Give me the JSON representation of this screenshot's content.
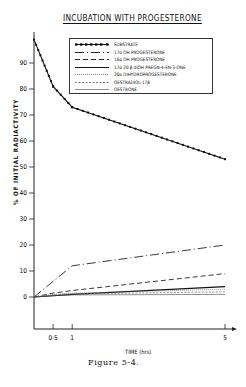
{
  "figure": {
    "title": "INCUBATION WITH PROGESTERONE",
    "caption": "Figure 5-4."
  },
  "chart_data": {
    "type": "line",
    "title": "INCUBATION WITH PROGESTERONE",
    "xlabel": "TIME (hrs)",
    "ylabel": "% OF INITIAL RADIACTIVITY",
    "x": [
      0,
      0.5,
      1,
      5
    ],
    "xticks": [
      "0·5",
      "1",
      "5"
    ],
    "xtick_values": [
      0.5,
      1,
      5
    ],
    "yticks": [
      0,
      10,
      20,
      30,
      40,
      50,
      60,
      70,
      80,
      90
    ],
    "xlim": [
      0,
      5.3
    ],
    "ylim": [
      -10,
      100
    ],
    "grid": false,
    "legend_position": "top-right inside",
    "series": [
      {
        "name": "SUBSTRATE",
        "style": "dotted-markers",
        "values": [
          99,
          81,
          73,
          53
        ]
      },
      {
        "name": "17α OH PROGESTERONE",
        "style": "dash-dot",
        "values": [
          0,
          6,
          12,
          20
        ]
      },
      {
        "name": "16α OH PROGESTERONE",
        "style": "dashed",
        "values": [
          0,
          1.5,
          2.5,
          9
        ]
      },
      {
        "name": "17α 20 β diOH PREGN-4-EN-3-ONE",
        "style": "solid",
        "values": [
          0,
          0.5,
          1,
          4
        ]
      },
      {
        "name": "20α DIHYDROPROGESTERONE",
        "style": "fine-dotted",
        "values": [
          0,
          1,
          1.5,
          3
        ]
      },
      {
        "name": "OESTRADIOL-17β",
        "style": "short-dashed",
        "values": [
          0,
          0.8,
          1.2,
          2
        ]
      },
      {
        "name": "OESTRONE",
        "style": "thin-solid",
        "values": [
          0,
          0.5,
          0.8,
          1
        ]
      }
    ]
  },
  "legend": {
    "items": [
      "SUBSTRATE",
      "17α OH PROGESTERONE",
      "16α OH PROGESTERONE",
      "17α 20 β diOH PREGN-4-EN-3-ONE",
      "20α DIHYDROPROGESTERONE",
      "OESTRADIOL-17β",
      "OESTRONE"
    ]
  }
}
